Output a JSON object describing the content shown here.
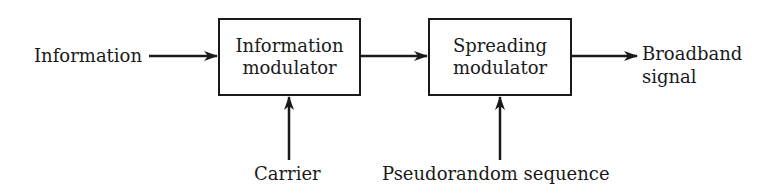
{
  "diagram": {
    "type": "block-diagram",
    "inputs": {
      "information": "Information",
      "carrier": "Carrier",
      "pseudorandom": "Pseudorandom sequence"
    },
    "blocks": [
      {
        "line1": "Information",
        "line2": "modulator"
      },
      {
        "line1": "Spreading",
        "line2": "modulator"
      }
    ],
    "output": {
      "line1": "Broadband",
      "line2": "signal"
    },
    "colors": {
      "stroke": "#1a1a1a",
      "background": "#ffffff"
    }
  }
}
